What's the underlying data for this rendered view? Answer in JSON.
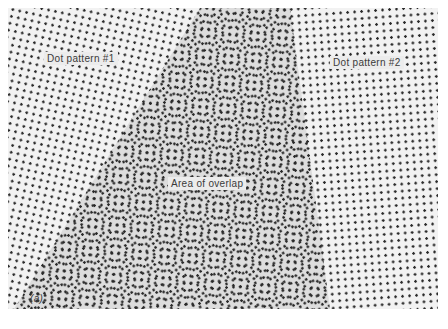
{
  "figure": {
    "labels": {
      "pattern1": "Dot pattern #1",
      "pattern2": "Dot pattern #2",
      "overlap": "Area of overlap",
      "panel": "(a)"
    },
    "colors": {
      "background": "#f2f2f2",
      "dots": "#2a2a2a",
      "label_text": "#3a3a3a"
    }
  }
}
